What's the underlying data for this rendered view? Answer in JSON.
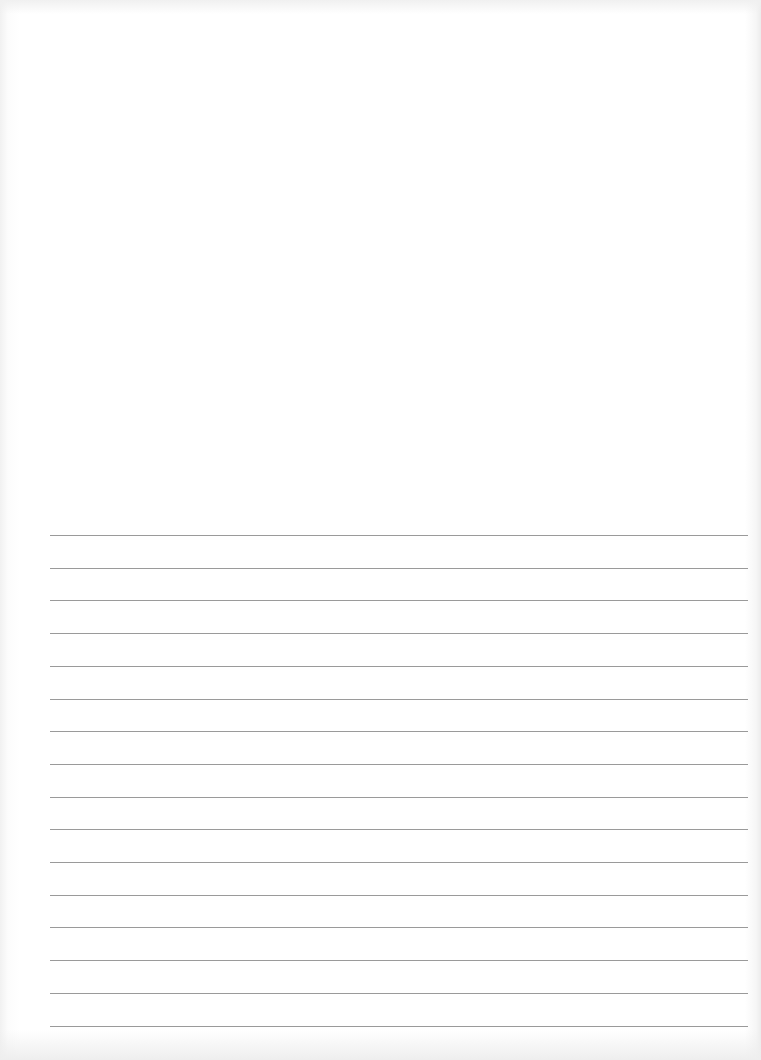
{
  "document": {
    "type": "ruled-page",
    "text_content": "",
    "line_count": 16,
    "line_color": "#9a9a9a",
    "paper_color": "#ffffff"
  }
}
